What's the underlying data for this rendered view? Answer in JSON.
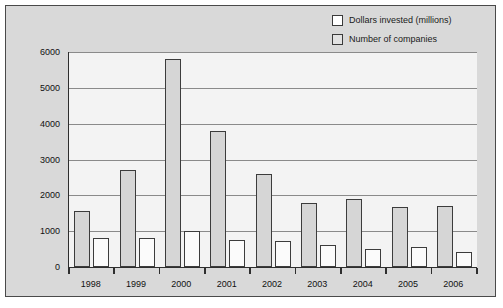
{
  "chart_data": {
    "type": "bar",
    "title": "",
    "subtitle": "",
    "xlabel": "",
    "ylabel": "",
    "categories": [
      "1998",
      "1999",
      "2000",
      "2001",
      "2002",
      "2003",
      "2004",
      "2005",
      "2006"
    ],
    "series": [
      {
        "name": "Dollars invested (millions)",
        "color": "#d6d6d6",
        "values": [
          1550,
          2700,
          5800,
          3800,
          2600,
          1800,
          1900,
          1680,
          1700
        ]
      },
      {
        "name": "Number of companies",
        "color": "#fbfbfb",
        "values": [
          820,
          820,
          1010,
          760,
          720,
          620,
          510,
          560,
          420
        ]
      }
    ],
    "ylim": [
      0,
      6000
    ],
    "yticks": [
      0,
      1000,
      2000,
      3000,
      4000,
      5000,
      6000
    ],
    "ytick_labels": [
      "0",
      "1000",
      "2000",
      "3000",
      "4000",
      "5000",
      "6000"
    ],
    "grid": true,
    "legend_position": "top-right",
    "colors": {
      "plot_background": "#f3f3f3",
      "figure_background": "#d9d9d9",
      "gridline": "#8a8a8a",
      "axis": "#2e2e2e",
      "text": "#111111"
    }
  },
  "legend": {
    "items": [
      {
        "label": "Dollars invested (millions)",
        "swatch": "#ffffff"
      },
      {
        "label": "Number of companies",
        "swatch": "#e2e2e2"
      }
    ]
  }
}
